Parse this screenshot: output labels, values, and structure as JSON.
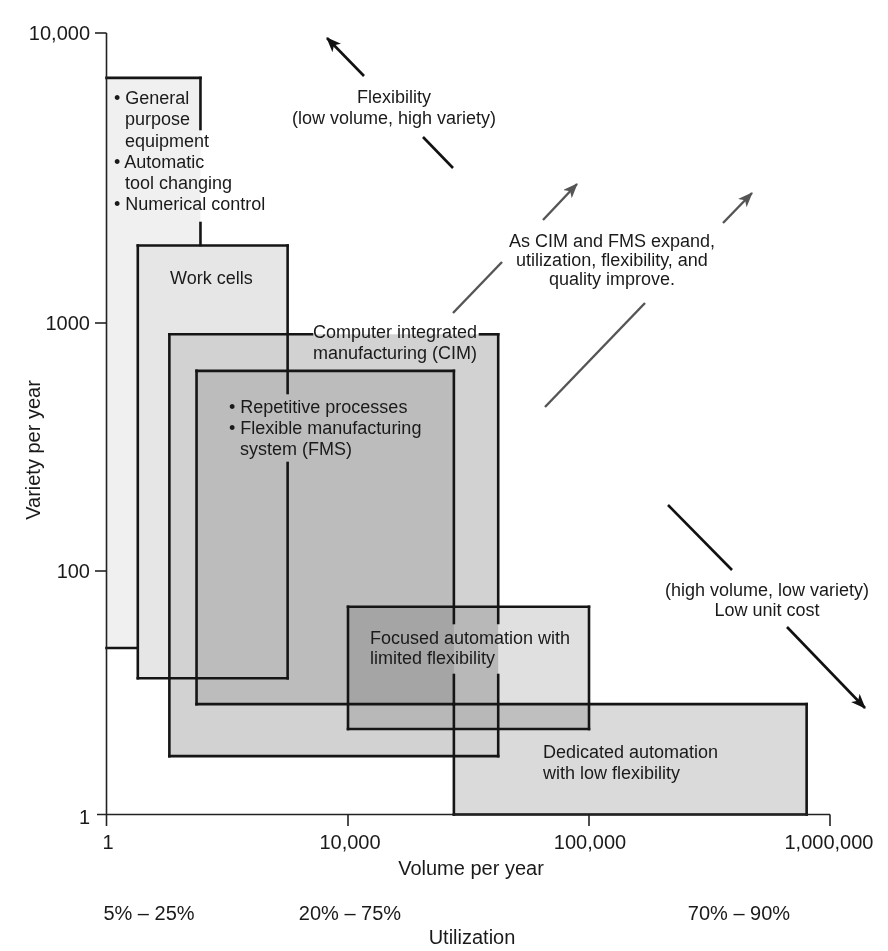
{
  "chart_data": {
    "type": "area",
    "subtype": "overlapping-regions",
    "title": "",
    "xlabel": "Volume per year",
    "ylabel": "Variety per year",
    "x_scale": "log",
    "y_scale": "log",
    "xlim": [
      1,
      1000000
    ],
    "ylim": [
      1,
      10000
    ],
    "grid": false,
    "legend": null,
    "xticks": [
      {
        "value": 1,
        "label": "1"
      },
      {
        "value": 10000,
        "label": "10,000"
      },
      {
        "value": 100000,
        "label": "100,000"
      },
      {
        "value": 1000000,
        "label": "1,000,000"
      }
    ],
    "yticks": [
      {
        "value": 10000,
        "label": "10,000"
      },
      {
        "value": 1000,
        "label": "1000"
      },
      {
        "value": 100,
        "label": "100"
      },
      {
        "value": 1,
        "label": "1"
      }
    ],
    "secondary_xaxis": {
      "label": "Utilization",
      "ranges": [
        {
          "label": "5% – 25%"
        },
        {
          "label": "20% – 75%"
        },
        {
          "label": "70% – 90%"
        }
      ]
    },
    "regions": [
      {
        "id": "general-purpose",
        "lines": [
          "• General",
          "purpose",
          "equipment",
          "• Automatic",
          "tool changing",
          "• Numerical control"
        ],
        "volume": [
          1,
          36
        ],
        "variety": [
          23,
          7000
        ],
        "fill": "#f0f0f0"
      },
      {
        "id": "work-cells",
        "lines": [
          "Work cells"
        ],
        "volume": [
          3.3,
          1000
        ],
        "variety": [
          13,
          1850
        ],
        "fill": "#e6e6e6"
      },
      {
        "id": "cim",
        "lines": [
          "Computer integrated",
          "manufacturing (CIM)"
        ],
        "volume": [
          11,
          42000
        ],
        "variety": [
          3,
          900
        ],
        "fill": "#d2d2d2"
      },
      {
        "id": "fms",
        "lines": [
          "• Repetitive processes",
          "• Flexible manufacturing",
          "system (FMS)"
        ],
        "volume": [
          31,
          27500
        ],
        "variety": [
          8,
          640
        ],
        "fill": "#bcbcbc"
      },
      {
        "id": "focused-automation",
        "lines": [
          "Focused automation with",
          "limited flexibility"
        ],
        "volume": [
          10000,
          100000
        ],
        "variety": [
          5,
          50
        ],
        "fill": "#e0e0e0"
      },
      {
        "id": "dedicated-automation",
        "lines": [
          "Dedicated automation",
          "with low flexibility"
        ],
        "volume": [
          27500,
          800000
        ],
        "variety": [
          1,
          8
        ],
        "fill": "#dadada"
      }
    ],
    "annotations": [
      {
        "id": "flexibility",
        "lines": [
          "Flexibility",
          "(low volume, high variety)"
        ],
        "arrow": "up-left",
        "color": "#111111"
      },
      {
        "id": "cim-fms-expand",
        "lines": [
          "As CIM and FMS expand,",
          "utilization, flexibility, and",
          "quality improve."
        ],
        "arrow": "up-right",
        "color": "#555555"
      },
      {
        "id": "low-unit-cost",
        "lines": [
          "(high volume, low variety)",
          "Low unit cost"
        ],
        "arrow": "down-right",
        "color": "#111111"
      }
    ]
  }
}
